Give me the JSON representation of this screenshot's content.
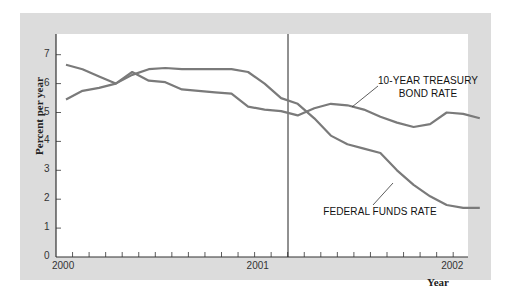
{
  "chart_data": {
    "type": "line",
    "title": "",
    "xlabel": "Year",
    "ylabel": "Percent per year",
    "ylim": [
      0,
      7.7
    ],
    "y_ticks": [
      "0",
      "1",
      "2",
      "3",
      "4",
      "5",
      "6",
      "7"
    ],
    "x_ticks": [
      "2000",
      "2001",
      "2002"
    ],
    "grid": false,
    "legend": "inline annotations",
    "annotations": [
      "10-YEAR TREASURY BOND RATE",
      "FEDERAL FUNDS RATE"
    ],
    "reference_line": {
      "x": "2001-03",
      "description": "vertical line marking start of 2001 recession"
    },
    "x": [
      "2000-01",
      "2000-02",
      "2000-03",
      "2000-04",
      "2000-05",
      "2000-06",
      "2000-07",
      "2000-08",
      "2000-09",
      "2000-10",
      "2000-11",
      "2000-12",
      "2001-01",
      "2001-02",
      "2001-03",
      "2001-04",
      "2001-05",
      "2001-06",
      "2001-07",
      "2001-08",
      "2001-09",
      "2001-10",
      "2001-11",
      "2001-12",
      "2002-01",
      "2002-02"
    ],
    "series": [
      {
        "name": "10-Year Treasury Bond Rate",
        "values": [
          6.65,
          6.5,
          6.25,
          6.0,
          6.4,
          6.1,
          6.05,
          5.8,
          5.75,
          5.7,
          5.65,
          5.2,
          5.1,
          5.05,
          4.9,
          5.15,
          5.3,
          5.25,
          5.1,
          4.85,
          4.65,
          4.5,
          4.6,
          5.0,
          4.95,
          4.8
        ]
      },
      {
        "name": "Federal Funds Rate",
        "values": [
          5.45,
          5.75,
          5.85,
          6.0,
          6.3,
          6.5,
          6.54,
          6.5,
          6.5,
          6.5,
          6.5,
          6.4,
          6.0,
          5.5,
          5.3,
          4.8,
          4.2,
          3.9,
          3.75,
          3.6,
          3.0,
          2.5,
          2.1,
          1.8,
          1.7,
          1.7
        ]
      }
    ]
  },
  "axes": {
    "y_label": "Percent per year",
    "x_label": "Year",
    "y_tick_labels": [
      "0",
      "1",
      "2",
      "3",
      "4",
      "5",
      "6",
      "7"
    ],
    "x_tick_labels": [
      "2000",
      "2001",
      "2002"
    ]
  },
  "annotations": {
    "treasury_line1": "10-YEAR TREASURY",
    "treasury_line2": "BOND RATE",
    "fed_funds": "FEDERAL FUNDS RATE"
  },
  "colors": {
    "line": "#7a7a7a",
    "panel": "#dcdcdc",
    "axis": "#333333"
  }
}
